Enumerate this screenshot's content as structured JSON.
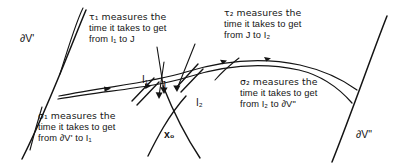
{
  "figure": {
    "kind": "geometry-diagram",
    "colors": {
      "ink": "#141414",
      "background": "#ffffff"
    }
  },
  "boundaries": [
    {
      "name": "boundary-left",
      "label": "∂V'"
    },
    {
      "name": "boundary-right",
      "label": "∂V\""
    }
  ],
  "points": [
    {
      "name": "point-I1",
      "label": "I₁"
    },
    {
      "name": "point-J",
      "label": "J"
    },
    {
      "name": "point-I2",
      "label": "I₂"
    },
    {
      "name": "point-x0",
      "label": "x₀"
    }
  ],
  "annotations": [
    {
      "name": "annotation-tau1",
      "symbol": "τ₁",
      "lines": [
        "τ₁  measures the",
        "time it takes to get",
        "from I₁ to J"
      ]
    },
    {
      "name": "annotation-tau2",
      "symbol": "τ₂",
      "lines": [
        "τ₂  measures the",
        "time it takes to get",
        "from  J  to I₂"
      ]
    },
    {
      "name": "annotation-sigma1",
      "symbol": "σ₁",
      "lines": [
        "σ₁  measures the",
        "time it takes to get",
        "from ∂V' to I₁"
      ]
    },
    {
      "name": "annotation-sigma2",
      "symbol": "σ₂",
      "lines": [
        "σ₂  measures the",
        "time it takes to get",
        "from  I₂  to ∂V\""
      ]
    }
  ]
}
